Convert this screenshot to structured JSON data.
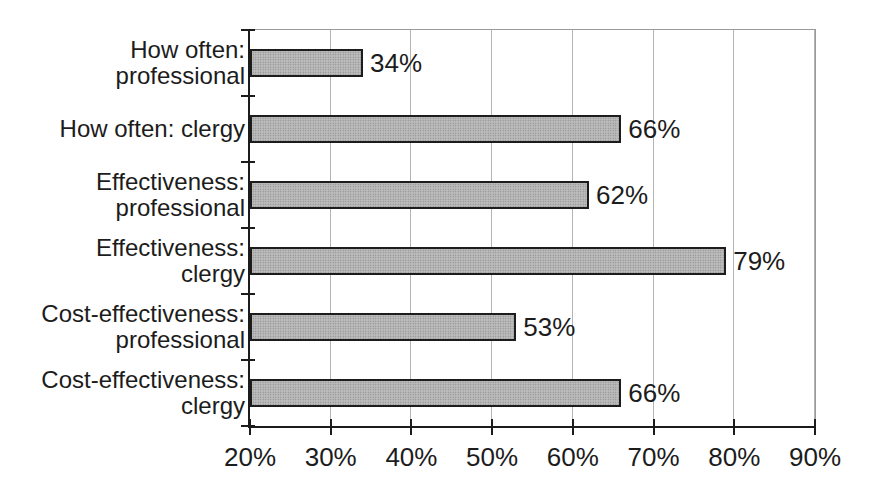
{
  "chart_data": {
    "type": "bar",
    "orientation": "horizontal",
    "title": "",
    "xlabel": "",
    "ylabel": "",
    "legend": "none",
    "grid": true,
    "categories": [
      "How often: professional",
      "How often: clergy",
      "Effectiveness: professional",
      "Effectiveness: clergy",
      "Cost-effectiveness: professional",
      "Cost-effectiveness: clergy"
    ],
    "category_lines": [
      [
        "How often:",
        "professional"
      ],
      [
        "How often: clergy"
      ],
      [
        "Effectiveness:",
        "professional"
      ],
      [
        "Effectiveness:",
        "clergy"
      ],
      [
        "Cost-effectiveness:",
        "professional"
      ],
      [
        "Cost-effectiveness:",
        "clergy"
      ]
    ],
    "values": [
      34,
      66,
      62,
      79,
      53,
      66
    ],
    "data_labels": [
      "34%",
      "66%",
      "62%",
      "79%",
      "53%",
      "66%"
    ],
    "xlim": [
      20,
      90
    ],
    "x_ticks": [
      20,
      30,
      40,
      50,
      60,
      70,
      80,
      90
    ],
    "x_tick_labels": [
      "20%",
      "30%",
      "40%",
      "50%",
      "60%",
      "70%",
      "80%",
      "90%"
    ],
    "colors": {
      "background": "#ffffff",
      "text": "#1c1c1c",
      "axis": "#1c1c1c",
      "gridline": "#b4b4b4",
      "frame": "#9a9a9a",
      "bar_border": "#1c1c1c",
      "bar_fill_base": "#bcbcbc",
      "bar_fill_dot": "#848484"
    }
  }
}
